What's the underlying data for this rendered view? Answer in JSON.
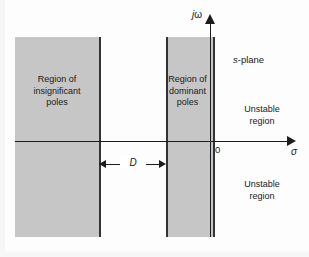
{
  "figure": {
    "plane_label": "s-plane",
    "plane_label_italic_part": "s",
    "plane_label_rest": "-plane",
    "background_color": "#fdfdfd",
    "shade_color": "#c6c6c6",
    "line_color": "#1c1c1c"
  },
  "axes": {
    "imaginary": {
      "label_italic_part": "j",
      "label_rest": "ω",
      "label_full": "jω",
      "name": "imaginary-axis",
      "direction": "up"
    },
    "real": {
      "label": "σ",
      "name": "real-axis",
      "direction": "right"
    },
    "origin_label": "0"
  },
  "regions": [
    {
      "id": "insignificant",
      "lines": [
        "Region of",
        "insignificant",
        "poles"
      ],
      "text": "Region of insignificant poles",
      "fill": "#c6c6c6"
    },
    {
      "id": "dominant",
      "lines": [
        "Region of",
        "dominant",
        "poles"
      ],
      "text": "Region of dominant poles",
      "fill": "#c6c6c6"
    }
  ],
  "annotations": {
    "unstable_upper": {
      "lines": [
        "Unstable",
        "region"
      ],
      "text": "Unstable region"
    },
    "unstable_lower": {
      "lines": [
        "Unstable",
        "region"
      ],
      "text": "Unstable region"
    },
    "dimension": {
      "label": "D",
      "description": "separation between insignificant and dominant pole regions"
    }
  },
  "chart_data": {
    "type": "diagram",
    "xlabel": "σ",
    "ylabel": "jω",
    "shapes": [
      {
        "name": "region-of-insignificant-poles",
        "kind": "rectangle",
        "label": "Region of insignificant poles",
        "fill": "#c6c6c6",
        "px": {
          "left": 15,
          "top": 37,
          "width": 84,
          "height": 200
        }
      },
      {
        "name": "region-of-dominant-poles",
        "kind": "rectangle",
        "label": "Region of dominant poles",
        "fill": "#c6c6c6",
        "px": {
          "left": 166,
          "top": 37,
          "width": 45,
          "height": 200
        }
      }
    ],
    "axis_px": {
      "origin_x": 210,
      "origin_y": 141
    },
    "gap_px": {
      "from_x": 99,
      "to_x": 166,
      "label": "D"
    },
    "legend": "none",
    "grid": false
  }
}
